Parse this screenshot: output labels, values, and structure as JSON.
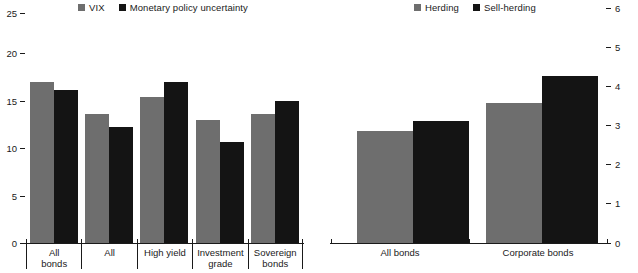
{
  "chart_data": [
    {
      "panel": "left",
      "type": "bar",
      "title": "",
      "xlabel": "",
      "ylabel": "",
      "ylim": [
        0,
        25
      ],
      "yticks": [
        0,
        5,
        10,
        15,
        20,
        25
      ],
      "ytick_labels": [
        "0",
        "5",
        "10",
        "15",
        "20",
        "25"
      ],
      "grid": false,
      "legend_position": "top-center",
      "categories": [
        "All bonds",
        "All",
        "High yield",
        "Investment grade",
        "Sovereign bonds"
      ],
      "series": [
        {
          "name": "VIX",
          "color": "#6e6e6e",
          "values": [
            20.1,
            16.1,
            18.3,
            15.4,
            16.1
          ]
        },
        {
          "name": "Monetary policy uncertainty",
          "color": "#141414",
          "values": [
            19.1,
            14.5,
            20.1,
            12.6,
            17.7
          ]
        }
      ]
    },
    {
      "panel": "right",
      "type": "bar",
      "title": "",
      "xlabel": "",
      "ylabel": "",
      "ylim": [
        0,
        6
      ],
      "yticks": [
        0,
        1,
        2,
        3,
        4,
        5,
        6
      ],
      "ytick_labels": [
        "0",
        "1",
        "2",
        "3",
        "4",
        "5",
        "6"
      ],
      "grid": false,
      "legend_position": "top-center",
      "categories": [
        "All bonds",
        "Corporate bonds"
      ],
      "series": [
        {
          "name": "Herding",
          "color": "#6e6e6e",
          "values": [
            3.35,
            4.2
          ]
        },
        {
          "name": "Sell-herding",
          "color": "#141414",
          "values": [
            3.65,
            5.0
          ]
        }
      ]
    }
  ],
  "left_panel": {
    "legend": [
      {
        "label": "VIX",
        "swatch": "gray-square-icon"
      },
      {
        "label": "Monetary policy uncertainty",
        "swatch": "black-square-icon"
      }
    ],
    "axis": {
      "labels": [
        "25",
        "20",
        "15",
        "10",
        "5",
        "0"
      ]
    },
    "categories": [
      {
        "line1": "All",
        "line2": "bonds"
      },
      {
        "line1": "All",
        "line2": ""
      },
      {
        "line1": "High yield",
        "line2": ""
      },
      {
        "line1": "Investment",
        "line2": "grade"
      },
      {
        "line1": "Sovereign",
        "line2": "bonds"
      }
    ]
  },
  "right_panel": {
    "legend": [
      {
        "label": "Herding",
        "swatch": "gray-square-icon"
      },
      {
        "label": "Sell-herding",
        "swatch": "black-square-icon"
      }
    ],
    "axis": {
      "labels": [
        "6",
        "5",
        "4",
        "3",
        "2",
        "1",
        "0"
      ]
    },
    "categories": [
      {
        "line1": "All bonds",
        "line2": ""
      },
      {
        "line1": "Corporate bonds",
        "line2": ""
      }
    ]
  }
}
